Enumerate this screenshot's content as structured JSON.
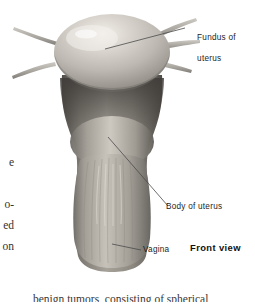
{
  "figure": {
    "view_label": "Front view",
    "background_color": "#ffffff",
    "line_color": "#4a4a4a",
    "palette": {
      "fundus_light": "#d8d4cd",
      "fundus_mid": "#b3afa8",
      "fundus_highlight": "#efece6",
      "shadow_band": "#4e4b47",
      "body_mid": "#8f8b84",
      "vagina_light": "#b8b4ac",
      "vagina_mid": "#99958d",
      "outline": "#5d5a55",
      "tube_gray": "#a9a5a0"
    }
  },
  "labels": [
    {
      "id": "fundus",
      "line1": "Fundus of",
      "line2": "uterus"
    },
    {
      "id": "body",
      "line1": "Body of uterus",
      "line2": ""
    },
    {
      "id": "vagina",
      "line1": "Vagina",
      "line2": ""
    },
    {
      "id": "view",
      "line1": "Front view",
      "line2": ""
    }
  ],
  "margin_text": {
    "lines": "e\n\no-\ned\non"
  },
  "bottom_caption": {
    "text": "benign tumors, consisting of spherical"
  }
}
